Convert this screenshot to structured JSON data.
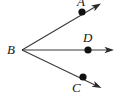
{
  "figure": {
    "type": "geometry-diagram",
    "background_color": "#ffffff",
    "stroke_color": "#3a3a3a",
    "label_color": "#161616",
    "width": 121,
    "height": 100
  },
  "labels": {
    "vertex": "B",
    "upper_point": "A",
    "middle_point": "D",
    "lower_point": "C"
  },
  "points": [
    {
      "name": "B",
      "label": "B",
      "x": 22,
      "y": 50,
      "label_x": 8,
      "label_y": 44,
      "dot": false
    },
    {
      "name": "A",
      "label": "A",
      "x": 82,
      "y": 12,
      "label_x": 76,
      "label_y": -3,
      "dot": true
    },
    {
      "name": "D",
      "label": "D",
      "x": 88,
      "y": 50,
      "label_x": 82,
      "label_y": 31,
      "dot": true
    },
    {
      "name": "C",
      "label": "C",
      "x": 83,
      "y": 77,
      "label_x": 71,
      "label_y": 81,
      "dot": true
    }
  ],
  "rays": [
    {
      "name": "ray-BA",
      "from": "B",
      "through": "A",
      "x1": 22,
      "y1": 50,
      "x2": 100,
      "y2": 4
    },
    {
      "name": "ray-BD",
      "from": "B",
      "through": "D",
      "x1": 22,
      "y1": 50,
      "x2": 113,
      "y2": 50
    },
    {
      "name": "ray-BC",
      "from": "B",
      "through": "C",
      "x1": 22,
      "y1": 50,
      "x2": 101,
      "y2": 88
    }
  ],
  "arrowheads": [
    {
      "name": "arrowhead-upper",
      "x": 100,
      "y": 4,
      "angle": -30.5
    },
    {
      "name": "arrowhead-middle",
      "x": 113,
      "y": 50,
      "angle": 0
    },
    {
      "name": "arrowhead-lower",
      "x": 101,
      "y": 88,
      "angle": 25.7
    }
  ]
}
